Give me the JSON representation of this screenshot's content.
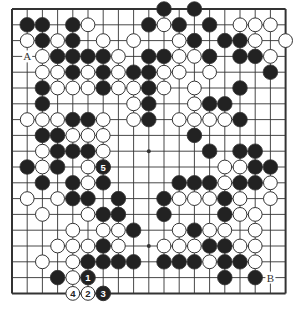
{
  "diagram": {
    "type": "go-board",
    "size": 19,
    "grid": {
      "x0": 12,
      "y0": 9,
      "dx": 15.2,
      "dy": 15.8
    },
    "colors": {
      "line": "#333333",
      "black": "#222222",
      "white": "#ffffff",
      "stone_outline": "#333333",
      "background": "#ffffff"
    },
    "star_points": [
      [
        3,
        3
      ],
      [
        9,
        3
      ],
      [
        15,
        3
      ],
      [
        3,
        9
      ],
      [
        9,
        9
      ],
      [
        15,
        9
      ],
      [
        3,
        15
      ],
      [
        9,
        15
      ],
      [
        15,
        15
      ]
    ],
    "stones": {
      "black": [
        [
          10,
          0
        ],
        [
          12,
          0
        ],
        [
          1,
          1
        ],
        [
          2,
          1
        ],
        [
          4,
          1
        ],
        [
          9,
          1
        ],
        [
          11,
          1
        ],
        [
          13,
          1
        ],
        [
          2,
          2
        ],
        [
          4,
          2
        ],
        [
          12,
          2
        ],
        [
          14,
          2
        ],
        [
          15,
          2
        ],
        [
          3,
          3
        ],
        [
          4,
          3
        ],
        [
          5,
          3
        ],
        [
          6,
          3
        ],
        [
          9,
          3
        ],
        [
          10,
          3
        ],
        [
          13,
          3
        ],
        [
          15,
          3
        ],
        [
          16,
          3
        ],
        [
          4,
          4
        ],
        [
          6,
          4
        ],
        [
          8,
          4
        ],
        [
          9,
          4
        ],
        [
          17,
          4
        ],
        [
          2,
          5
        ],
        [
          6,
          5
        ],
        [
          9,
          5
        ],
        [
          15,
          5
        ],
        [
          2,
          6
        ],
        [
          9,
          6
        ],
        [
          13,
          6
        ],
        [
          14,
          6
        ],
        [
          4,
          7
        ],
        [
          5,
          7
        ],
        [
          9,
          7
        ],
        [
          15,
          7
        ],
        [
          2,
          8
        ],
        [
          3,
          8
        ],
        [
          12,
          8
        ],
        [
          3,
          9
        ],
        [
          4,
          9
        ],
        [
          5,
          9
        ],
        [
          13,
          9
        ],
        [
          15,
          9
        ],
        [
          16,
          9
        ],
        [
          1,
          10
        ],
        [
          3,
          10
        ],
        [
          16,
          10
        ],
        [
          17,
          10
        ],
        [
          2,
          11
        ],
        [
          4,
          11
        ],
        [
          6,
          11
        ],
        [
          11,
          11
        ],
        [
          12,
          11
        ],
        [
          13,
          11
        ],
        [
          15,
          11
        ],
        [
          16,
          11
        ],
        [
          4,
          12
        ],
        [
          5,
          12
        ],
        [
          7,
          12
        ],
        [
          10,
          12
        ],
        [
          14,
          12
        ],
        [
          6,
          13
        ],
        [
          7,
          13
        ],
        [
          10,
          13
        ],
        [
          14,
          13
        ],
        [
          8,
          14
        ],
        [
          12,
          14
        ],
        [
          6,
          15
        ],
        [
          13,
          15
        ],
        [
          14,
          15
        ],
        [
          5,
          16
        ],
        [
          6,
          16
        ],
        [
          7,
          16
        ],
        [
          8,
          16
        ],
        [
          10,
          16
        ],
        [
          11,
          16
        ],
        [
          12,
          16
        ],
        [
          14,
          16
        ],
        [
          15,
          16
        ],
        [
          3,
          17
        ],
        [
          14,
          17
        ],
        [
          16,
          17
        ]
      ],
      "white": [
        [
          5,
          1
        ],
        [
          10,
          1
        ],
        [
          15,
          1
        ],
        [
          16,
          1
        ],
        [
          17,
          1
        ],
        [
          1,
          2
        ],
        [
          3,
          2
        ],
        [
          6,
          2
        ],
        [
          8,
          2
        ],
        [
          11,
          2
        ],
        [
          16,
          2
        ],
        [
          18,
          2
        ],
        [
          2,
          3
        ],
        [
          7,
          3
        ],
        [
          11,
          3
        ],
        [
          12,
          3
        ],
        [
          17,
          3
        ],
        [
          2,
          4
        ],
        [
          3,
          4
        ],
        [
          5,
          4
        ],
        [
          7,
          4
        ],
        [
          10,
          4
        ],
        [
          11,
          4
        ],
        [
          13,
          4
        ],
        [
          3,
          5
        ],
        [
          4,
          5
        ],
        [
          5,
          5
        ],
        [
          7,
          5
        ],
        [
          8,
          5
        ],
        [
          10,
          5
        ],
        [
          12,
          5
        ],
        [
          8,
          6
        ],
        [
          12,
          6
        ],
        [
          1,
          7
        ],
        [
          2,
          7
        ],
        [
          3,
          7
        ],
        [
          6,
          7
        ],
        [
          8,
          7
        ],
        [
          11,
          7
        ],
        [
          12,
          7
        ],
        [
          13,
          7
        ],
        [
          14,
          7
        ],
        [
          4,
          8
        ],
        [
          5,
          8
        ],
        [
          6,
          8
        ],
        [
          2,
          9
        ],
        [
          6,
          9
        ],
        [
          2,
          10
        ],
        [
          5,
          10
        ],
        [
          14,
          10
        ],
        [
          15,
          10
        ],
        [
          5,
          11
        ],
        [
          14,
          11
        ],
        [
          17,
          11
        ],
        [
          1,
          12
        ],
        [
          3,
          12
        ],
        [
          11,
          12
        ],
        [
          12,
          12
        ],
        [
          13,
          12
        ],
        [
          15,
          12
        ],
        [
          17,
          12
        ],
        [
          2,
          13
        ],
        [
          5,
          13
        ],
        [
          15,
          13
        ],
        [
          16,
          13
        ],
        [
          4,
          14
        ],
        [
          6,
          14
        ],
        [
          7,
          14
        ],
        [
          11,
          14
        ],
        [
          13,
          14
        ],
        [
          14,
          14
        ],
        [
          16,
          14
        ],
        [
          3,
          15
        ],
        [
          4,
          15
        ],
        [
          5,
          15
        ],
        [
          7,
          15
        ],
        [
          10,
          15
        ],
        [
          11,
          15
        ],
        [
          12,
          15
        ],
        [
          15,
          15
        ],
        [
          16,
          15
        ],
        [
          2,
          16
        ],
        [
          4,
          16
        ],
        [
          13,
          16
        ],
        [
          16,
          16
        ],
        [
          4,
          17
        ]
      ]
    },
    "numbered_moves": [
      {
        "number": "1",
        "color": "black",
        "col": 5,
        "row": 17
      },
      {
        "number": "2",
        "color": "white",
        "col": 5,
        "row": 18
      },
      {
        "number": "3",
        "color": "black",
        "col": 6,
        "row": 18
      },
      {
        "number": "4",
        "color": "white",
        "col": 4,
        "row": 18
      },
      {
        "number": "5",
        "color": "black",
        "col": 6,
        "row": 10
      }
    ],
    "labels": [
      {
        "text": "A",
        "col": 1,
        "row": 3
      },
      {
        "text": "B",
        "col": 17,
        "row": 17
      }
    ]
  }
}
